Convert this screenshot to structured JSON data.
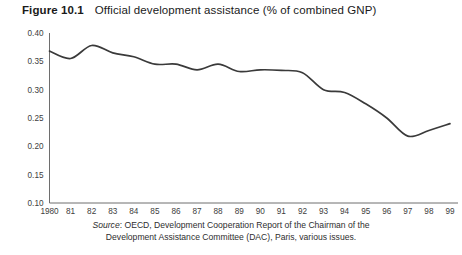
{
  "figure": {
    "label": "Figure 10.1",
    "caption": "Official development assistance (% of combined GNP)"
  },
  "source": {
    "prefix": "Source",
    "line1_rest": ": OECD, Development Cooperation Report of the Chairman of the",
    "line2": "Development Assistance Committee (DAC), Paris, various issues."
  },
  "colors": {
    "line": "#3a3a3a",
    "axis": "#6e6e6e",
    "text": "#1a1a1a",
    "background": "#ffffff"
  },
  "chart_data": {
    "type": "line",
    "title": "Official development assistance (% of combined GNP)",
    "xlabel": "",
    "ylabel": "",
    "grid": false,
    "legend": "none",
    "ylim": [
      0.1,
      0.4
    ],
    "ytick_labels": [
      "0.40",
      "0.35",
      "0.30",
      "0.25",
      "0.20",
      "0.15",
      "0.10"
    ],
    "ytick_values": [
      0.4,
      0.35,
      0.3,
      0.25,
      0.2,
      0.15,
      0.1
    ],
    "xtick_labels": [
      "1980",
      "81",
      "82",
      "83",
      "84",
      "85",
      "86",
      "87",
      "88",
      "89",
      "90",
      "91",
      "92",
      "93",
      "94",
      "95",
      "96",
      "97",
      "98",
      "99"
    ],
    "x": [
      1980,
      1981,
      1982,
      1983,
      1984,
      1985,
      1986,
      1987,
      1988,
      1989,
      1990,
      1991,
      1992,
      1993,
      1994,
      1995,
      1996,
      1997,
      1998,
      1999
    ],
    "series": [
      {
        "name": "Official development assistance (% of combined GNP)",
        "values": [
          0.368,
          0.355,
          0.378,
          0.365,
          0.358,
          0.345,
          0.345,
          0.335,
          0.345,
          0.332,
          0.335,
          0.334,
          0.33,
          0.3,
          0.295,
          0.275,
          0.25,
          0.218,
          0.228,
          0.24
        ]
      }
    ]
  }
}
